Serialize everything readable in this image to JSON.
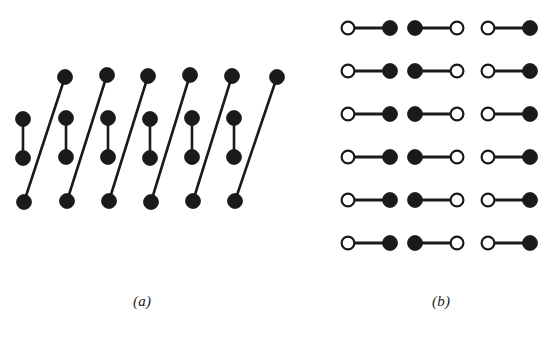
{
  "figure": {
    "width": 560,
    "height": 339,
    "background": "#ffffff",
    "ink_color": "#1a1a1a",
    "open_fill_color": "#ffffff",
    "panels": [
      {
        "id": "panel-a",
        "label": "(a)",
        "label_position": {
          "x": 133,
          "y": 293
        },
        "description": "linear forest of six paths plus one extra vertex, drawn as zig-zag of vertical and diagonal edges",
        "vertex_radius": 7.5,
        "edge_width": 2.6,
        "rows": {
          "top_y": 77,
          "mid_upper_y": 118,
          "mid_lower_y": 157,
          "bottom_y": 200
        },
        "vertices": [
          {
            "name": "a-top-1",
            "x": 65,
            "y": 77,
            "style": "filled"
          },
          {
            "name": "a-top-2",
            "x": 107,
            "y": 75,
            "style": "filled"
          },
          {
            "name": "a-top-3",
            "x": 148,
            "y": 76,
            "style": "filled"
          },
          {
            "name": "a-top-4",
            "x": 190,
            "y": 75,
            "style": "filled"
          },
          {
            "name": "a-top-5",
            "x": 232,
            "y": 76,
            "style": "filled"
          },
          {
            "name": "a-top-6",
            "x": 277,
            "y": 77,
            "style": "filled"
          },
          {
            "name": "a-mid-upper-1",
            "x": 23,
            "y": 119,
            "style": "filled"
          },
          {
            "name": "a-mid-upper-2",
            "x": 66,
            "y": 118,
            "style": "filled"
          },
          {
            "name": "a-mid-upper-3",
            "x": 108,
            "y": 118,
            "style": "filled"
          },
          {
            "name": "a-mid-upper-4",
            "x": 150,
            "y": 119,
            "style": "filled"
          },
          {
            "name": "a-mid-upper-5",
            "x": 192,
            "y": 118,
            "style": "filled"
          },
          {
            "name": "a-mid-upper-6",
            "x": 234,
            "y": 118,
            "style": "filled"
          },
          {
            "name": "a-mid-lower-1",
            "x": 23,
            "y": 158,
            "style": "filled"
          },
          {
            "name": "a-mid-lower-2",
            "x": 66,
            "y": 157,
            "style": "filled"
          },
          {
            "name": "a-mid-lower-3",
            "x": 108,
            "y": 157,
            "style": "filled"
          },
          {
            "name": "a-mid-lower-4",
            "x": 150,
            "y": 158,
            "style": "filled"
          },
          {
            "name": "a-mid-lower-5",
            "x": 192,
            "y": 157,
            "style": "filled"
          },
          {
            "name": "a-mid-lower-6",
            "x": 234,
            "y": 157,
            "style": "filled"
          },
          {
            "name": "a-bottom-1",
            "x": 24,
            "y": 202,
            "style": "filled"
          },
          {
            "name": "a-bottom-2",
            "x": 67,
            "y": 201,
            "style": "filled"
          },
          {
            "name": "a-bottom-3",
            "x": 109,
            "y": 201,
            "style": "filled"
          },
          {
            "name": "a-bottom-4",
            "x": 151,
            "y": 202,
            "style": "filled"
          },
          {
            "name": "a-bottom-5",
            "x": 193,
            "y": 201,
            "style": "filled"
          },
          {
            "name": "a-bottom-6",
            "x": 235,
            "y": 201,
            "style": "filled"
          }
        ],
        "edges": [
          {
            "name": "a-vertical-edge-1",
            "x1": 23,
            "y1": 119,
            "x2": 23,
            "y2": 158
          },
          {
            "name": "a-vertical-edge-2",
            "x1": 66,
            "y1": 118,
            "x2": 66,
            "y2": 157
          },
          {
            "name": "a-vertical-edge-3",
            "x1": 108,
            "y1": 118,
            "x2": 108,
            "y2": 157
          },
          {
            "name": "a-vertical-edge-4",
            "x1": 150,
            "y1": 119,
            "x2": 150,
            "y2": 158
          },
          {
            "name": "a-vertical-edge-5",
            "x1": 192,
            "y1": 118,
            "x2": 192,
            "y2": 157
          },
          {
            "name": "a-vertical-edge-6",
            "x1": 234,
            "y1": 118,
            "x2": 234,
            "y2": 157
          },
          {
            "name": "a-diagonal-edge-1",
            "x1": 24,
            "y1": 202,
            "x2": 65,
            "y2": 77
          },
          {
            "name": "a-diagonal-edge-2",
            "x1": 67,
            "y1": 201,
            "x2": 107,
            "y2": 75
          },
          {
            "name": "a-diagonal-edge-3",
            "x1": 109,
            "y1": 201,
            "x2": 148,
            "y2": 76
          },
          {
            "name": "a-diagonal-edge-4",
            "x1": 151,
            "y1": 202,
            "x2": 190,
            "y2": 75
          },
          {
            "name": "a-diagonal-edge-5",
            "x1": 193,
            "y1": 201,
            "x2": 232,
            "y2": 76
          },
          {
            "name": "a-diagonal-edge-6",
            "x1": 235,
            "y1": 201,
            "x2": 277,
            "y2": 77
          }
        ]
      },
      {
        "id": "panel-b",
        "label": "(b)",
        "label_position": {
          "x": 432,
          "y": 293
        },
        "description": "perfect matching of eighteen edges arranged in a 3 column by 6 row grid of dumbbells",
        "vertex_radius": 7.5,
        "open_vertex_radius": 7.5,
        "open_stroke_width": 2.2,
        "edge_width": 2.8,
        "grid": {
          "columns": 3,
          "rows": 6,
          "column_left_x": [
            348,
            415,
            488
          ],
          "column_right_x": [
            390,
            457,
            530
          ],
          "row_y": [
            28,
            71,
            114,
            157,
            200,
            243
          ],
          "column_patterns": [
            "open-filled",
            "filled-open",
            "open-filled"
          ]
        },
        "edges": [
          {
            "name": "b-edge-r1c1",
            "row": 1,
            "col": 1,
            "x1": 348,
            "y1": 28,
            "x2": 390,
            "y2": 28,
            "left_style": "open",
            "right_style": "filled"
          },
          {
            "name": "b-edge-r1c2",
            "row": 1,
            "col": 2,
            "x1": 415,
            "y1": 28,
            "x2": 457,
            "y2": 28,
            "left_style": "filled",
            "right_style": "open"
          },
          {
            "name": "b-edge-r1c3",
            "row": 1,
            "col": 3,
            "x1": 488,
            "y1": 28,
            "x2": 530,
            "y2": 28,
            "left_style": "open",
            "right_style": "filled"
          },
          {
            "name": "b-edge-r2c1",
            "row": 2,
            "col": 1,
            "x1": 348,
            "y1": 71,
            "x2": 390,
            "y2": 71,
            "left_style": "open",
            "right_style": "filled"
          },
          {
            "name": "b-edge-r2c2",
            "row": 2,
            "col": 2,
            "x1": 415,
            "y1": 71,
            "x2": 457,
            "y2": 71,
            "left_style": "filled",
            "right_style": "open"
          },
          {
            "name": "b-edge-r2c3",
            "row": 2,
            "col": 3,
            "x1": 488,
            "y1": 71,
            "x2": 530,
            "y2": 71,
            "left_style": "open",
            "right_style": "filled"
          },
          {
            "name": "b-edge-r3c1",
            "row": 3,
            "col": 1,
            "x1": 348,
            "y1": 114,
            "x2": 390,
            "y2": 114,
            "left_style": "open",
            "right_style": "filled"
          },
          {
            "name": "b-edge-r3c2",
            "row": 3,
            "col": 2,
            "x1": 415,
            "y1": 114,
            "x2": 457,
            "y2": 114,
            "left_style": "filled",
            "right_style": "open"
          },
          {
            "name": "b-edge-r3c3",
            "row": 3,
            "col": 3,
            "x1": 488,
            "y1": 114,
            "x2": 530,
            "y2": 114,
            "left_style": "open",
            "right_style": "filled"
          },
          {
            "name": "b-edge-r4c1",
            "row": 4,
            "col": 1,
            "x1": 348,
            "y1": 157,
            "x2": 390,
            "y2": 157,
            "left_style": "open",
            "right_style": "filled"
          },
          {
            "name": "b-edge-r4c2",
            "row": 4,
            "col": 2,
            "x1": 415,
            "y1": 157,
            "x2": 457,
            "y2": 157,
            "left_style": "filled",
            "right_style": "open"
          },
          {
            "name": "b-edge-r4c3",
            "row": 4,
            "col": 3,
            "x1": 488,
            "y1": 157,
            "x2": 530,
            "y2": 157,
            "left_style": "open",
            "right_style": "filled"
          },
          {
            "name": "b-edge-r5c1",
            "row": 5,
            "col": 1,
            "x1": 348,
            "y1": 200,
            "x2": 390,
            "y2": 200,
            "left_style": "open",
            "right_style": "filled"
          },
          {
            "name": "b-edge-r5c2",
            "row": 5,
            "col": 2,
            "x1": 415,
            "y1": 200,
            "x2": 457,
            "y2": 200,
            "left_style": "filled",
            "right_style": "open"
          },
          {
            "name": "b-edge-r5c3",
            "row": 5,
            "col": 3,
            "x1": 488,
            "y1": 200,
            "x2": 530,
            "y2": 200,
            "left_style": "open",
            "right_style": "filled"
          },
          {
            "name": "b-edge-r6c1",
            "row": 6,
            "col": 1,
            "x1": 348,
            "y1": 243,
            "x2": 390,
            "y2": 243,
            "left_style": "open",
            "right_style": "filled"
          },
          {
            "name": "b-edge-r6c2",
            "row": 6,
            "col": 2,
            "x1": 415,
            "y1": 243,
            "x2": 457,
            "y2": 243,
            "left_style": "filled",
            "right_style": "open"
          },
          {
            "name": "b-edge-r6c3",
            "row": 6,
            "col": 3,
            "x1": 488,
            "y1": 243,
            "x2": 530,
            "y2": 243,
            "left_style": "open",
            "right_style": "filled"
          }
        ]
      }
    ]
  }
}
